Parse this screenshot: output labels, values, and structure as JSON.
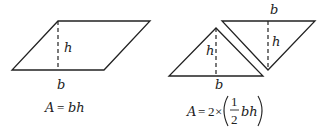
{
  "diagram": {
    "left_panel": {
      "shape": "parallelogram",
      "height_label": "h",
      "base_label": "b",
      "formula": {
        "lhs": "A",
        "eq": "=",
        "rhs": "bh"
      }
    },
    "right_panel": {
      "shape": "two-triangles",
      "triangle_up": {
        "height_label": "h",
        "base_label": "b"
      },
      "triangle_down": {
        "height_label": "h",
        "base_label": "b"
      },
      "formula": {
        "lhs": "A",
        "eq": "=",
        "coef": "2",
        "times": "×",
        "frac_num": "1",
        "frac_den": "2",
        "rhs": "bh"
      }
    },
    "stroke_color": "#222222",
    "background": "#ffffff"
  }
}
